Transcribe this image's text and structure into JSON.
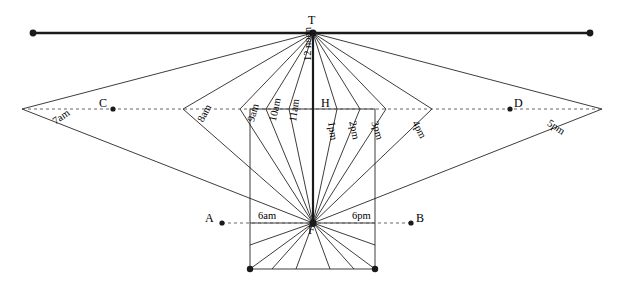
{
  "figure": {
    "type": "sundial-construction-diagram",
    "width": 618,
    "height": 285,
    "stroke_color": "#1a1a1a",
    "dotted_color": "#555555",
    "background": "#ffffff"
  },
  "points": [
    {
      "name": "T",
      "label": "T",
      "x": 313,
      "y": 33,
      "label_x": 308,
      "label_y": 14,
      "dot": true,
      "dot_r": 3.6
    },
    {
      "name": "H",
      "label": "H",
      "x": 313,
      "y": 109,
      "label_x": 321,
      "label_y": 97,
      "dot": false,
      "dot_r": 0
    },
    {
      "name": "F",
      "label": "F",
      "x": 313,
      "y": 223,
      "label_x": 308,
      "label_y": 224,
      "dot": true,
      "dot_r": 3.6
    },
    {
      "name": "C",
      "label": "C",
      "x": 113,
      "y": 109,
      "label_x": 99,
      "label_y": 97,
      "dot": true,
      "dot_r": 2.6
    },
    {
      "name": "D",
      "label": "D",
      "x": 510,
      "y": 109,
      "label_x": 514,
      "label_y": 97,
      "dot": true,
      "dot_r": 2.6
    },
    {
      "name": "A",
      "label": "A",
      "x": 222,
      "y": 223,
      "label_x": 205,
      "label_y": 212,
      "dot": true,
      "dot_r": 2.6
    },
    {
      "name": "B",
      "label": "B",
      "x": 411,
      "y": 223,
      "label_x": 416,
      "label_y": 212,
      "dot": true,
      "dot_r": 2.6
    }
  ],
  "horizon_line": {
    "name": "horizon-through-T",
    "x1": 33,
    "y1": 33,
    "x2": 590,
    "y2": 33,
    "end_dot_r": 3.4,
    "stroke_width": 2.4
  },
  "dotted_line": {
    "name": "horizontal-dotted-line-through-H",
    "x1": 22,
    "y1": 109,
    "x2": 602,
    "y2": 109,
    "dash": "3,3"
  },
  "dotted_line_AB": {
    "name": "dotted-line-A-B-through-F",
    "x1": 222,
    "y1": 223,
    "x2": 411,
    "y2": 223,
    "dash": "3,3"
  },
  "gnomon": {
    "name": "vertical-gnomon-axis-T-F",
    "x1": 313,
    "y1": 33,
    "x2": 313,
    "y2": 223,
    "stroke_width": 2.2
  },
  "dial_plate": {
    "name": "dial-plate-rectangle",
    "left": 250,
    "right": 375,
    "top": 109,
    "bottom": 269,
    "corner_dots": [
      {
        "x": 250,
        "y": 269,
        "r": 3.2
      },
      {
        "x": 375,
        "y": 269,
        "r": 3.2
      }
    ]
  },
  "hour_lines": [
    {
      "label": "7am",
      "vertex_x": 22,
      "vertex_y": 109,
      "label_x": 51,
      "label_y": 118,
      "rotate": 34,
      "side": "left"
    },
    {
      "label": "8am",
      "vertex_x": 183,
      "vertex_y": 109,
      "label_x": 196,
      "label_y": 119,
      "rotate": 62,
      "side": "left"
    },
    {
      "label": "9am",
      "vertex_x": 240,
      "vertex_y": 109,
      "label_x": 246,
      "label_y": 120,
      "rotate": 73,
      "side": "left"
    },
    {
      "label": "10am",
      "vertex_x": 266,
      "vertex_y": 109,
      "label_x": 268,
      "label_y": 120,
      "rotate": 78,
      "side": "left"
    },
    {
      "label": "11am",
      "vertex_x": 289,
      "vertex_y": 109,
      "label_x": 288,
      "label_y": 121,
      "rotate": 82,
      "side": "left"
    },
    {
      "label": "12 noon",
      "vertex_x": 313,
      "vertex_y": 109,
      "label_x": 303,
      "label_y": 61,
      "rotate": 90,
      "side": "center"
    },
    {
      "label": "1pm",
      "vertex_x": 337,
      "vertex_y": 109,
      "label_x": 336,
      "label_y": 121,
      "rotate": -82,
      "side": "right"
    },
    {
      "label": "2pm",
      "vertex_x": 360,
      "vertex_y": 109,
      "label_x": 357,
      "label_y": 120,
      "rotate": -78,
      "side": "right"
    },
    {
      "label": "3pm",
      "vertex_x": 386,
      "vertex_y": 109,
      "label_x": 379,
      "label_y": 120,
      "rotate": -73,
      "side": "right"
    },
    {
      "label": "4pm",
      "vertex_x": 432,
      "vertex_y": 109,
      "label_x": 419,
      "label_y": 119,
      "rotate": -62,
      "side": "right"
    },
    {
      "label": "5pm",
      "vertex_x": 602,
      "vertex_y": 109,
      "label_x": 551,
      "label_y": 118,
      "rotate": -34,
      "side": "right"
    }
  ],
  "base_hour_labels": [
    {
      "label": "6am",
      "x": 258,
      "y": 211
    },
    {
      "label": "6pm",
      "x": 352,
      "y": 211
    }
  ],
  "foot_lines": {
    "name": "hour-lines-below-F",
    "targets": [
      {
        "x": 250,
        "y": 245
      },
      {
        "x": 250,
        "y": 269
      },
      {
        "x": 272,
        "y": 269
      },
      {
        "x": 296,
        "y": 269
      },
      {
        "x": 330,
        "y": 269
      },
      {
        "x": 354,
        "y": 269
      },
      {
        "x": 375,
        "y": 269
      },
      {
        "x": 375,
        "y": 245
      }
    ]
  }
}
